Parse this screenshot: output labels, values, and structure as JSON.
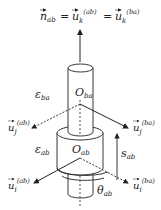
{
  "diagram": {
    "equation": {
      "n": "n",
      "n_sub": "ab",
      "eq1": "=",
      "u1": "u",
      "u1_sub": "k",
      "u1_sup": "(ab)",
      "eq2": "=",
      "u2": "u",
      "u2_sub": "k",
      "u2_sup": "(ba)"
    },
    "labels": {
      "eps_ba": {
        "sym": "ε",
        "sub": "ba"
      },
      "O_ba": {
        "sym": "O",
        "sub": "ba"
      },
      "eps_ab": {
        "sym": "ε",
        "sub": "ab"
      },
      "O_ab": {
        "sym": "O",
        "sub": "ab"
      },
      "s_ab": {
        "sym": "s",
        "sub": "ab"
      },
      "theta_ab": {
        "sym": "θ",
        "sub": "ab"
      },
      "u_j_ab": {
        "sym": "u",
        "sub": "j",
        "sup": "(ab)"
      },
      "u_j_ba": {
        "sym": "u",
        "sub": "j",
        "sup": "(ba)"
      },
      "u_i_ab": {
        "sym": "u",
        "sub": "i",
        "sup": "(ab)"
      },
      "u_i_ba": {
        "sym": "u",
        "sub": "i",
        "sup": "(ba)"
      }
    },
    "colors": {
      "stroke": "#222222",
      "background": "#ffffff"
    }
  }
}
